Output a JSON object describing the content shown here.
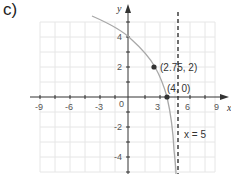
{
  "part_label": "c)",
  "graph": {
    "x_axis_label": "x",
    "y_axis_label": "y",
    "x_ticks": [
      "-9",
      "-6",
      "-3",
      "0",
      "3",
      "6",
      "9"
    ],
    "y_ticks": [
      "4",
      "2",
      "-2",
      "-4"
    ],
    "points": [
      {
        "label": "(2.75, 2)",
        "x": 2.75,
        "y": 2
      },
      {
        "label": "(4, 0)",
        "x": 4,
        "y": 0
      }
    ],
    "asymptote": {
      "label": "x = 5",
      "x": 5,
      "style": "dashed"
    },
    "curve_color": "#a8a8a8",
    "grid_color": "#e6e6e6",
    "axis_color": "#333333"
  }
}
